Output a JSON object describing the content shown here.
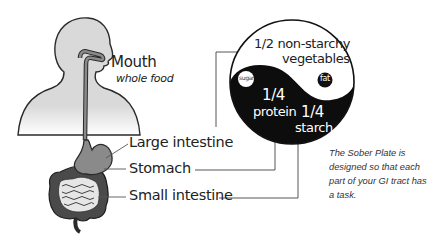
{
  "body_labels": {
    "mouth": "Mouth",
    "mouth_sub": "whole food",
    "large_intestine": "Large intestine",
    "stomach": "Stomach",
    "small_intestine": "Small intestine"
  },
  "plate": {
    "vegetables_fraction": "1/2 non-starchy",
    "vegetables_label": "vegetables",
    "sugar_label": "sugar",
    "fat_label": "fat",
    "protein_fraction": "1/4",
    "protein_label": "protein",
    "starch_fraction": "1/4",
    "starch_label": "starch"
  },
  "caption": "The Sober Plate is designed so that each part of your GI tract has a task.",
  "colors": {
    "body_fill": "#d9d9d9",
    "outline": "#2a2a2a",
    "plate_dark": "#0d0d0d",
    "plate_light": "#ffffff",
    "organ_dark": "#4a4a4a",
    "stomach_fill": "#8a8a8a"
  }
}
